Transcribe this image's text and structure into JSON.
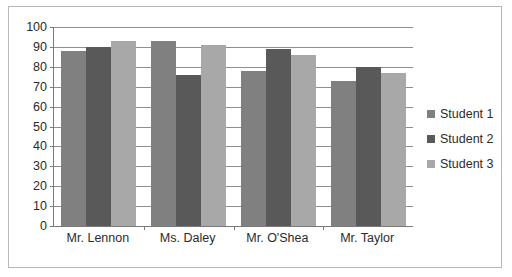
{
  "chart_data": {
    "type": "bar",
    "title": "",
    "xlabel": "",
    "ylabel": "",
    "ylim": [
      0,
      100
    ],
    "ytick_step": 10,
    "grid": true,
    "legend_position": "right",
    "categories": [
      "Mr. Lennon",
      "Ms. Daley",
      "Mr. O'Shea",
      "Mr. Taylor"
    ],
    "ytick_labels": [
      "100",
      "90",
      "80",
      "70",
      "60",
      "50",
      "40",
      "30",
      "20",
      "10",
      "0"
    ],
    "ytick_values": [
      100,
      90,
      80,
      70,
      60,
      50,
      40,
      30,
      20,
      10,
      0
    ],
    "series": [
      {
        "name": "Student 1",
        "color": "#808080",
        "values": [
          88,
          93,
          78,
          73
        ]
      },
      {
        "name": "Student 2",
        "color": "#595959",
        "values": [
          90,
          76,
          89,
          80
        ]
      },
      {
        "name": "Student 3",
        "color": "#a8a8a8",
        "values": [
          93,
          91,
          86,
          77
        ]
      }
    ]
  },
  "legend": {
    "entries": [
      {
        "label": "Student 1",
        "color": "#808080"
      },
      {
        "label": "Student 2",
        "color": "#595959"
      },
      {
        "label": "Student 3",
        "color": "#a8a8a8"
      }
    ]
  },
  "colors": {
    "frame_border": "#b9b9b9",
    "axis": "#7a7a7a",
    "gridline": "#8f8f8f",
    "text": "#2b2b2b",
    "background": "#ffffff"
  }
}
